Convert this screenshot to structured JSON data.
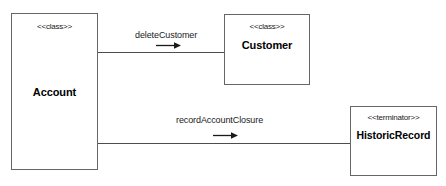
{
  "diagram": {
    "type": "uml-collaboration-diagram",
    "background_color": "#ffffff",
    "line_color": "#4d4d4d",
    "border_color": "#666666",
    "text_color": "#000000",
    "nodes": [
      {
        "id": "account",
        "stereotype": "<<class>>",
        "name": "Account"
      },
      {
        "id": "customer",
        "stereotype": "<<class>>",
        "name": "Customer"
      },
      {
        "id": "historicrecord",
        "stereotype": "<<terminator>>",
        "name": "HistoricRecord"
      }
    ],
    "edges": [
      {
        "id": "delete-customer",
        "label": "deleteCustomer",
        "from": "Account",
        "to": "Customer",
        "direction": "right",
        "arrow_icon": "arrow-right-icon"
      },
      {
        "id": "record-account-closure",
        "label": "recordAccountClosure",
        "from": "Account",
        "to": "HistoricRecord",
        "direction": "right",
        "arrow_icon": "arrow-right-icon"
      }
    ]
  }
}
